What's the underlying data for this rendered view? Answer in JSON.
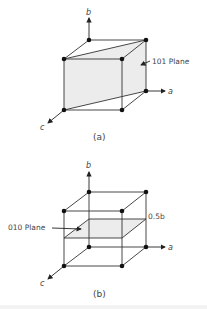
{
  "figure_a": {
    "caption": "(a)",
    "axes": {
      "a": "a",
      "b": "b",
      "c": "c"
    },
    "plane_label": "101 Plane",
    "plane_fill": "#eeeeee"
  },
  "figure_b": {
    "caption": "(b)",
    "axes": {
      "a": "a",
      "b": "b",
      "c": "c"
    },
    "plane_label": "010 Plane",
    "height_label": "0.5b",
    "plane_fill": "#eeeeee"
  }
}
